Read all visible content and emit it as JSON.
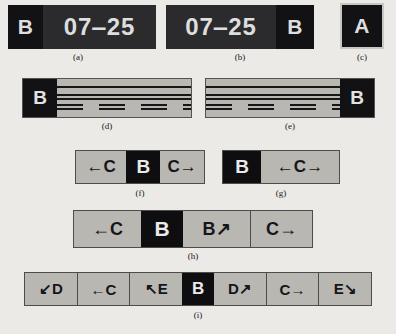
{
  "figure": {
    "background_color": "#eceae6",
    "ink_color": "#17171a",
    "sign_background": "#b9b7b2",
    "panel_black": "#121214",
    "panel_dark_gray": "#2b2b2e",
    "text_light": "#dedede"
  },
  "captions": {
    "a": "(a)",
    "b": "(b)",
    "c": "(c)",
    "d": "(d)",
    "e": "(e)",
    "f": "(f)",
    "g": "(g)",
    "h": "(h)",
    "i": "(i)"
  },
  "panel_a": {
    "segments": [
      {
        "label": "B",
        "style": "black"
      },
      {
        "label": "07‒25",
        "style": "dark-gray"
      }
    ]
  },
  "panel_b": {
    "segments": [
      {
        "label": "07‒25",
        "style": "dark-gray"
      },
      {
        "label": "B",
        "style": "black"
      }
    ]
  },
  "panel_c": {
    "label": "A",
    "style": "black-bordered"
  },
  "panel_d": {
    "end_label": "B",
    "end_position": "left",
    "lane_lines": [
      "solid-edge",
      "double-center-line-1",
      "double-center-line-2",
      "dashed-lane-1",
      "dashed-lane-2"
    ]
  },
  "panel_e": {
    "end_label": "B",
    "end_position": "right",
    "lane_lines": [
      "solid-edge",
      "double-center-line-1",
      "double-center-line-2",
      "dashed-lane-1",
      "dashed-lane-2"
    ]
  },
  "panel_f": {
    "cells": [
      {
        "label": "←C",
        "style": "light"
      },
      {
        "label": "B",
        "style": "black"
      },
      {
        "label": "C→",
        "style": "light"
      }
    ]
  },
  "panel_g": {
    "cells": [
      {
        "label": "B",
        "style": "black"
      },
      {
        "label": "←C→",
        "style": "light"
      }
    ]
  },
  "panel_h": {
    "cells": [
      {
        "label": "←C",
        "style": "light",
        "divider": false
      },
      {
        "label": "B",
        "style": "black",
        "divider": false
      },
      {
        "label": "B↗",
        "style": "light",
        "divider": false
      },
      {
        "label": "C→",
        "style": "light",
        "divider": true
      }
    ]
  },
  "panel_i": {
    "cells": [
      {
        "label": "↙D",
        "style": "light",
        "divider": false
      },
      {
        "label": "←C",
        "style": "light",
        "divider": true
      },
      {
        "label": "↖E",
        "style": "light",
        "divider": true
      },
      {
        "label": "B",
        "style": "black",
        "divider": false
      },
      {
        "label": "D↗",
        "style": "light",
        "divider": false
      },
      {
        "label": "C→",
        "style": "light",
        "divider": true
      },
      {
        "label": "E↘",
        "style": "light",
        "divider": true
      }
    ]
  }
}
